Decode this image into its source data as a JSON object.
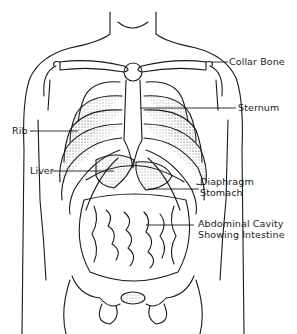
{
  "diagram": {
    "colors": {
      "ink": "#1a1a1a",
      "shading": "#b8b8b8",
      "background": "#ffffff"
    },
    "labels": {
      "collar_bone": "Collar Bone",
      "sternum": "Sternum",
      "rib": "Rib",
      "liver": "Liver",
      "diaphragm": "Diaphragm",
      "stomach": "Stomach",
      "abdominal_line1": "Abdominal Cavity",
      "abdominal_line2": "Showing Intestine"
    }
  }
}
